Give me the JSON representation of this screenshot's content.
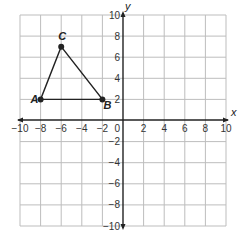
{
  "diagram": {
    "type": "coordinate-plane",
    "x_range": [
      -10,
      10
    ],
    "y_range": [
      -10,
      10
    ],
    "grid_step": 2,
    "axis_labels": {
      "x": "x",
      "y": "y"
    },
    "origin_label": "0",
    "x_tick_labels": [
      "−10",
      "−8",
      "−6",
      "−4",
      "−2",
      "2",
      "4",
      "6",
      "8",
      "10"
    ],
    "y_tick_labels": [
      "10",
      "8",
      "6",
      "4",
      "2",
      "−2",
      "−4",
      "−6",
      "−8",
      "−10"
    ],
    "points": [
      {
        "name": "A",
        "x": -8,
        "y": 2
      },
      {
        "name": "B",
        "x": -2,
        "y": 2
      },
      {
        "name": "C",
        "x": -6,
        "y": 7
      }
    ],
    "shape": "triangle ABC",
    "colors": {
      "grid": "#bdbdbd",
      "axis": "#222222",
      "shape": "#222222"
    }
  }
}
